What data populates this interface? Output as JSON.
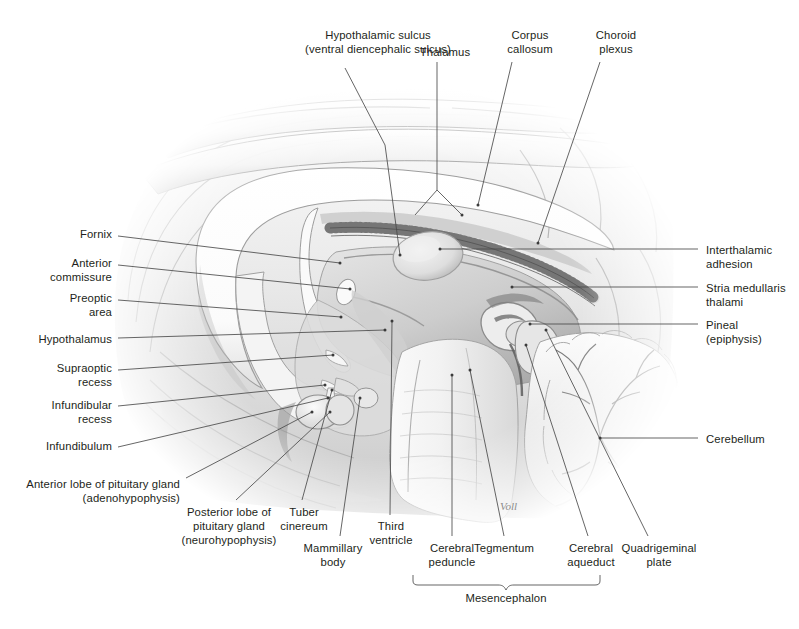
{
  "figure": {
    "signature": "Voll",
    "line_color": "#4a4a4a",
    "text_color": "#231f20",
    "background": "#ffffff",
    "bracket_label": "Mesencephalon"
  },
  "labels": {
    "top": [
      {
        "id": "hypothalamic-sulcus",
        "text": "Hypothalamic sulcus\n(ventral diencephalic sulcus)",
        "align": "center",
        "x": 273,
        "y": 28,
        "w": 210
      },
      {
        "id": "thalamus",
        "text": "Thalamus",
        "align": "center",
        "x": 400,
        "y": 45,
        "w": 90
      },
      {
        "id": "corpus-callosum",
        "text": "Corpus\ncallosum",
        "align": "center",
        "x": 490,
        "y": 28,
        "w": 80
      },
      {
        "id": "choroid-plexus",
        "text": "Choroid\nplexus",
        "align": "center",
        "x": 578,
        "y": 28,
        "w": 76
      }
    ],
    "left": [
      {
        "id": "fornix",
        "text": "Fornix",
        "align": "right",
        "x": 16,
        "y": 227,
        "w": 96
      },
      {
        "id": "anterior-commissure",
        "text": "Anterior\ncommissure",
        "align": "right",
        "x": 12,
        "y": 256,
        "w": 100
      },
      {
        "id": "preoptic-area",
        "text": "Preoptic\narea",
        "align": "right",
        "x": 12,
        "y": 291,
        "w": 100
      },
      {
        "id": "hypothalamus",
        "text": "Hypothalamus",
        "align": "right",
        "x": 6,
        "y": 332,
        "w": 106
      },
      {
        "id": "supraoptic-recess",
        "text": "Supraoptic\nrecess",
        "align": "right",
        "x": 12,
        "y": 361,
        "w": 100
      },
      {
        "id": "infundibular-recess",
        "text": "Infundibular\nrecess",
        "align": "right",
        "x": 12,
        "y": 398,
        "w": 100
      },
      {
        "id": "infundibulum",
        "text": "Infundibulum",
        "align": "right",
        "x": 6,
        "y": 439,
        "w": 106
      },
      {
        "id": "anterior-lobe-pituitary",
        "text": "Anterior lobe of pituitary gland\n(adenohypophysis)",
        "align": "right",
        "x": 24,
        "y": 477,
        "w": 156
      }
    ],
    "bottom": [
      {
        "id": "posterior-lobe-pituitary",
        "text": "Posterior lobe of\npituitary gland\n(neurohypophysis)",
        "align": "center",
        "x": 168,
        "y": 505,
        "w": 122
      },
      {
        "id": "tuber-cinereum",
        "text": "Tuber\ncinereum",
        "align": "center",
        "x": 268,
        "y": 505,
        "w": 72
      },
      {
        "id": "mammillary-body",
        "text": "Mammillary\nbody",
        "align": "center",
        "x": 288,
        "y": 541,
        "w": 90
      },
      {
        "id": "third-ventricle",
        "text": "Third\nventricle",
        "align": "center",
        "x": 356,
        "y": 519,
        "w": 70
      },
      {
        "id": "cerebral-peduncle",
        "text": "Cerebral\npeduncle",
        "align": "center",
        "x": 412,
        "y": 541,
        "w": 80
      },
      {
        "id": "tegmentum",
        "text": "Tegmentum",
        "align": "center",
        "x": 462,
        "y": 541,
        "w": 84
      },
      {
        "id": "cerebral-aqueduct",
        "text": "Cerebral\naqueduct",
        "align": "center",
        "x": 552,
        "y": 541,
        "w": 78
      },
      {
        "id": "quadrigeminal-plate",
        "text": "Quadrigeminal\nplate",
        "align": "center",
        "x": 608,
        "y": 541,
        "w": 102
      }
    ],
    "right": [
      {
        "id": "interthalamic-adhesion",
        "text": "Interthalamic\nadhesion",
        "align": "left",
        "x": 706,
        "y": 243,
        "w": 94
      },
      {
        "id": "stria-medullaris-thalami",
        "text": "Stria medullaris\nthalami",
        "align": "left",
        "x": 706,
        "y": 281,
        "w": 94
      },
      {
        "id": "pineal-epiphysis",
        "text": "Pineal\n(epiphysis)",
        "align": "left",
        "x": 706,
        "y": 318,
        "w": 94
      },
      {
        "id": "cerebellum",
        "text": "Cerebellum",
        "align": "left",
        "x": 706,
        "y": 432,
        "w": 94
      }
    ]
  },
  "leaders": [
    {
      "id": "leader-hypothalamic-sulcus",
      "d": "M 345 68 L 385 145 L 400 255"
    },
    {
      "id": "leader-thalamus",
      "d": "M 437 62 L 437 190 L 415 215 M 437 190 L 462 215"
    },
    {
      "id": "leader-corpus-callosum",
      "d": "M 512 62 L 478 205"
    },
    {
      "id": "leader-choroid-plexus",
      "d": "M 600 62 L 538 243"
    },
    {
      "id": "leader-fornix",
      "d": "M 118 236 L 340 263"
    },
    {
      "id": "leader-anterior-commissure",
      "d": "M 118 265 L 350 289"
    },
    {
      "id": "leader-preoptic-area",
      "d": "M 118 300 L 341 317"
    },
    {
      "id": "leader-hypothalamus",
      "d": "M 118 338 L 385 330"
    },
    {
      "id": "leader-supraoptic-recess",
      "d": "M 118 370 L 333 355"
    },
    {
      "id": "leader-infundibular-recess",
      "d": "M 118 406 L 325 385"
    },
    {
      "id": "leader-infundibulum",
      "d": "M 118 447 L 328 398"
    },
    {
      "id": "leader-anterior-lobe",
      "d": "M 186 478 L 312 412"
    },
    {
      "id": "leader-posterior-lobe",
      "d": "M 236 500 L 330 412"
    },
    {
      "id": "leader-tuber-cinereum",
      "d": "M 302 500 L 332 390"
    },
    {
      "id": "leader-mammillary-body",
      "d": "M 340 536 L 360 398"
    },
    {
      "id": "leader-third-ventricle",
      "d": "M 390 515 L 392 321"
    },
    {
      "id": "leader-cerebral-peduncle",
      "d": "M 452 536 L 452 375"
    },
    {
      "id": "leader-tegmentum",
      "d": "M 504 536 L 470 370"
    },
    {
      "id": "leader-cerebral-aqueduct",
      "d": "M 588 536 L 526 345"
    },
    {
      "id": "leader-quadrigeminal-plate",
      "d": "M 648 536 L 546 330"
    },
    {
      "id": "leader-interthalamic-adhesion",
      "d": "M 698 249 L 440 249"
    },
    {
      "id": "leader-stria-medullaris",
      "d": "M 698 287 L 512 287"
    },
    {
      "id": "leader-pineal",
      "d": "M 698 324 L 530 324"
    },
    {
      "id": "leader-cerebellum",
      "d": "M 698 438 L 600 438"
    }
  ]
}
